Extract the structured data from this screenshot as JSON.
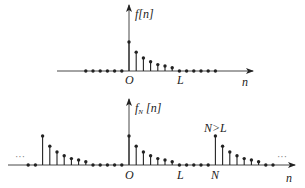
{
  "diagram": {
    "top_plot": {
      "function_label": "f[n]",
      "origin_label": "O",
      "length_label": "L",
      "axis_label": "n",
      "stem_values": [
        1.0,
        0.65,
        0.45,
        0.32,
        0.22,
        0.17,
        0.11
      ],
      "zero_samples_left": 6,
      "zero_samples_right": 6
    },
    "bottom_plot": {
      "function_label_main": "f",
      "function_label_sub": "N",
      "function_label_arg": "[n]",
      "origin_label": "O",
      "length_label": "L",
      "period_label": "N",
      "condition_label": "N>L",
      "axis_label": "n",
      "ellipsis_left": "···",
      "ellipsis_right": "···",
      "stem_values": [
        1.0,
        0.65,
        0.45,
        0.32,
        0.22,
        0.17,
        0.11
      ],
      "zeros_between_periods": 5
    },
    "colors": {
      "line": "#222222",
      "axis": "#333333",
      "ellipsis": "#888888"
    }
  }
}
